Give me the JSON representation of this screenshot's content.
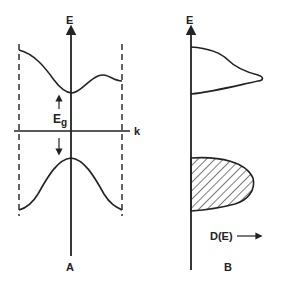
{
  "diagram": {
    "panels": [
      {
        "id": "A",
        "caption": "A",
        "y_axis_label": "E",
        "x_axis_label": "k",
        "gap_label": "E",
        "gap_subscript": "g",
        "curves": [
          "conduction-band",
          "valence-band"
        ],
        "boundaries": "dashed zone boundaries"
      },
      {
        "id": "B",
        "caption": "B",
        "y_axis_label": "E",
        "x_axis_label": "D(E)",
        "regions": [
          "empty-upper-band-density",
          "filled-lower-band-density (hatched)"
        ]
      }
    ],
    "colors": {
      "ink": "#222222",
      "background": "#ffffff"
    }
  }
}
